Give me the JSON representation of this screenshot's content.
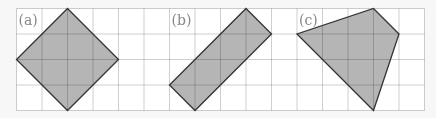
{
  "figure": {
    "grid": {
      "cols": 16,
      "rows": 4,
      "origin_x": 16.5,
      "origin_y": 8.5,
      "cell": 25.5,
      "line_color": "#cfcfcf",
      "bg_color": "#ffffff"
    },
    "shape_fill": "#b5b5b5",
    "shape_stroke": "#333333",
    "panels": [
      {
        "label": "(a)",
        "label_cell": [
          0,
          0
        ],
        "vertices": [
          [
            2,
            0
          ],
          [
            4,
            2
          ],
          [
            2,
            4
          ],
          [
            0,
            2
          ]
        ]
      },
      {
        "label": "(b)",
        "label_cell": [
          6,
          0
        ],
        "vertices": [
          [
            9,
            0
          ],
          [
            10,
            1
          ],
          [
            7,
            4
          ],
          [
            6,
            3
          ]
        ]
      },
      {
        "label": "(c)",
        "label_cell": [
          11,
          0
        ],
        "vertices": [
          [
            14,
            0
          ],
          [
            15,
            1
          ],
          [
            14,
            4
          ],
          [
            11,
            1
          ]
        ]
      }
    ]
  }
}
